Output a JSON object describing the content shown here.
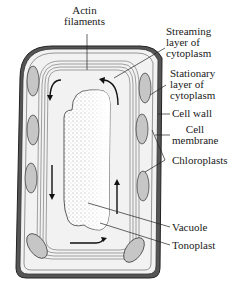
{
  "figure": {
    "colors": {
      "cell_wall_outer": "#4a4a4a",
      "cytoplasm_fill": "#f0f0f0",
      "chloroplast_fill": "#c8c8c8",
      "vacuole_stipple": "#8a8a8a",
      "line": "#222222"
    }
  },
  "labels": {
    "actin": "Actin\nfilaments",
    "streaming": "Streaming\nlayer of\ncytoplasm",
    "stationary": "Stationary\nlayer of\ncytoplasm",
    "cell_wall": "Cell wall",
    "cell_membrane": "Cell\nmembrane",
    "chloroplasts": "Chloroplasts",
    "vacuole": "Vacuole",
    "tonoplast": "Tonoplast"
  }
}
